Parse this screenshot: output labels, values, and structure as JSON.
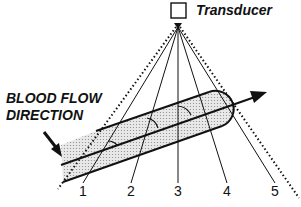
{
  "diagram": {
    "transducer_label": "Transducer",
    "flow_label_line1": "BLOOD FLOW",
    "flow_label_line2": "DIRECTION",
    "beam_labels": [
      "1",
      "2",
      "3",
      "4",
      "5"
    ],
    "colors": {
      "ink": "#111111",
      "vessel_fill": "#d9d9d9",
      "background": "#ffffff"
    }
  }
}
